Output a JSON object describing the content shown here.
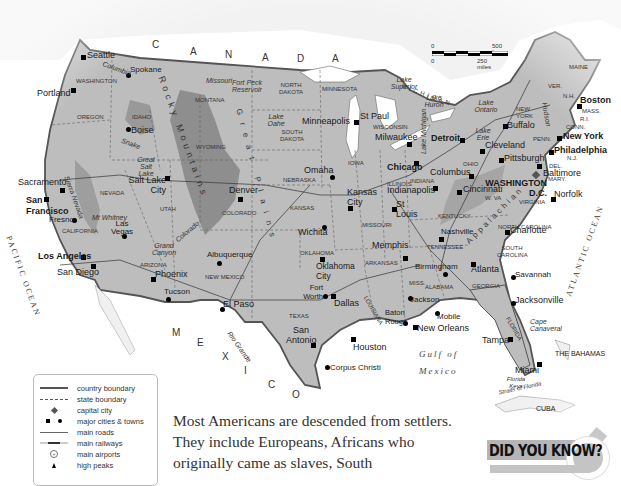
{
  "map": {
    "title": "United States of America",
    "countries": [
      {
        "name": "CANADA",
        "spaced": true
      },
      {
        "name": "MEXICO",
        "spaced": true
      },
      {
        "name": "THE BAHAMAS"
      },
      {
        "name": "CUBA"
      }
    ],
    "water_labels": {
      "pacific": "PACIFIC OCEAN",
      "atlantic": "ATLANTIC OCEAN",
      "gulf_line1": "Gulf of",
      "gulf_line2": "Mexico",
      "straits": "Straits of Florida"
    },
    "scale": {
      "km_start": "0",
      "km_end": "500 km",
      "mi_start": "0",
      "mi_end": "250 miles"
    },
    "states": [
      "WASHINGTON",
      "OREGON",
      "IDAHO",
      "MONTANA",
      "NORTH DAKOTA",
      "SOUTH DAKOTA",
      "MINNESOTA",
      "WYOMING",
      "NEBRASKA",
      "IOWA",
      "WISCONSIN",
      "MICHIGAN",
      "NEVADA",
      "UTAH",
      "COLORADO",
      "KANSAS",
      "ILLINOIS",
      "INDIANA",
      "OHIO",
      "PENN.",
      "NEW YORK",
      "CALIFORNIA",
      "ARIZONA",
      "NEW MEXICO",
      "OKLAHOMA",
      "MISSOURI",
      "KENTUCKY",
      "W. VA",
      "VIRGINIA",
      "TENNESSEE",
      "ARKANSAS",
      "NORTH CAROLINA",
      "SOUTH CAROLINA",
      "TEXAS",
      "LOUISIANA",
      "MISS.",
      "ALABAMA",
      "GEORGIA",
      "FLORIDA",
      "MAINE",
      "VER.",
      "N.H.",
      "MASS.",
      "R.I.",
      "CONN.",
      "N.J.",
      "DEL.",
      "MARY."
    ],
    "cities": {
      "seattle": "Seattle",
      "spokane": "Spokane",
      "portland": "Portland",
      "boise": "Boise",
      "sacramento": "Sacramento",
      "san_francisco": "San Francisco",
      "fresno": "Fresno",
      "las_vegas": "Las Vegas",
      "los_angeles": "Los Angeles",
      "san_diego": "San Diego",
      "phoenix": "Phoenix",
      "tucson": "Tucson",
      "salt_lake_city": "Salt Lake City",
      "denver": "Denver",
      "albuquerque": "Albuquerque",
      "el_paso": "El Paso",
      "minneapolis": "Minneapolis",
      "st_paul": "St Paul",
      "milwaukee": "Milwaukee",
      "chicago": "Chicago",
      "detroit": "Detroit",
      "omaha": "Omaha",
      "kansas_city": "Kansas City",
      "wichita": "Wichita",
      "st_louis": "St Louis",
      "indianapolis": "Indianapolis",
      "columbus": "Columbus",
      "cincinnati": "Cincinnati",
      "cleveland": "Cleveland",
      "buffalo": "Buffalo",
      "pittsburgh": "Pittsburgh",
      "boston": "Boston",
      "new_york": "New York",
      "philadelphia": "Philadelphia",
      "baltimore": "Baltimore",
      "washington": "WASHINGTON D.C.",
      "norfolk": "Norfolk",
      "nashville": "Nashville",
      "memphis": "Memphis",
      "charlotte": "Charlotte",
      "atlanta": "Atlanta",
      "savannah": "Savannah",
      "jacksonville": "Jacksonville",
      "birmingham": "Birmingham",
      "jackson": "Jackson",
      "mobile": "Mobile",
      "baton_rouge": "Baton Rouge",
      "new_orleans": "New Orleans",
      "oklahoma_city": "Oklahoma City",
      "fort_worth": "Fort Worth",
      "dallas": "Dallas",
      "san_antonio": "San Antonio",
      "houston": "Houston",
      "corpus_christi": "Corpus Christi",
      "tampa": "Tampa",
      "miami": "Miami"
    },
    "physical": {
      "rocky": "Rocky Mountains",
      "great_plains": "Great Plains",
      "appalachian": "Appalachian",
      "lake_superior": "Lake Superior",
      "lake_michigan": "Lake Michigan",
      "lake_huron": "Lake Huron",
      "lake_erie": "Lake Erie",
      "lake_ontario": "Lake Ontario",
      "great_salt_lake": "Great Salt Lake",
      "lake_oahe": "Lake Oahe",
      "fort_peck": "Fort Peck Reservoir",
      "missouri": "Missouri",
      "mississippi": "Mississippi",
      "columbia": "Columbia",
      "snake": "Snake",
      "colorado_r": "Colorado",
      "rio_grande": "Rio Grande",
      "hudson": "Hudson",
      "ohio_r": "Ohio",
      "arkansas_r": "Arkansas",
      "sierra_nevada": "Sierra Nevada",
      "mt_whitney": "Mt Whitney",
      "grand_canyon": "Grand Canyon",
      "cape_canaveral": "Cape Canaveral",
      "florida_keys": "Florida Keys"
    }
  },
  "legend": {
    "items": [
      {
        "label": "country boundary"
      },
      {
        "label": "state boundary"
      },
      {
        "label": "capital city"
      },
      {
        "label": "major cities & towns"
      },
      {
        "label": "main roads"
      },
      {
        "label": "main railways"
      },
      {
        "label": "main airports"
      },
      {
        "label": "high peaks"
      }
    ]
  },
  "body_text": "Most Americans are descended from settlers. They include Europeans, Africans who originally came as slaves, South",
  "sidebar": {
    "did_you_know": "DID YOU KNOW?"
  },
  "colors": {
    "land_light": "#bdbdbd",
    "land_mid": "#a9a9a9",
    "mountain": "#8e8e8e",
    "water": "#ffffff",
    "border": "#555555"
  }
}
